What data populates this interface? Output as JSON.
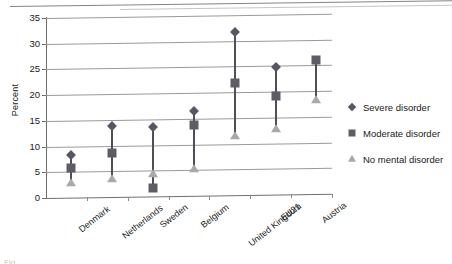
{
  "figure": {
    "caption_fragment": "Fig"
  },
  "chart_data": {
    "type": "scatter",
    "title": "",
    "xlabel": "",
    "ylabel": "Percent",
    "ylim": [
      0,
      35
    ],
    "yticks": [
      0,
      5,
      10,
      15,
      20,
      25,
      30,
      35
    ],
    "grid": true,
    "legend_position": "right",
    "categories": [
      "Denmark",
      "Netherlands",
      "Sweden",
      "Belgium",
      "United Kingdom",
      "EU21",
      "Austria"
    ],
    "series": [
      {
        "name": "Severe disorder",
        "marker": "diamond",
        "color": "#575763",
        "values": [
          8.3,
          13.8,
          13.4,
          16.5,
          31.8,
          24.8,
          null
        ]
      },
      {
        "name": "Moderate disorder",
        "marker": "square",
        "color": "#5d5d66",
        "values": [
          5.8,
          8.6,
          1.7,
          13.8,
          21.8,
          19.1,
          26.1
        ]
      },
      {
        "name": "No mental disorder",
        "marker": "triangle",
        "color": "#a9a9a9",
        "values": [
          2.8,
          3.6,
          4.4,
          5.2,
          11.5,
          12.8,
          18.3
        ]
      }
    ]
  }
}
